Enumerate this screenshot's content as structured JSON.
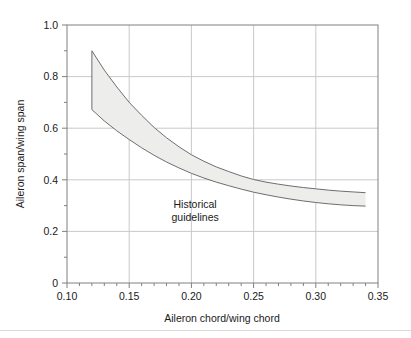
{
  "figure": {
    "background_color": "#ffffff",
    "plot_area": {
      "left_px": 67,
      "top_px": 25,
      "right_px": 378,
      "bottom_px": 283,
      "frame_color": "#808080",
      "grid_color": "#c9c9c9"
    },
    "footer_rule_y_px": 330,
    "footer_rule_color": "#d9d9d9"
  },
  "chart_data": {
    "type": "area",
    "title": "",
    "subtitle": "",
    "xlabel": "Aileron chord/wing chord",
    "ylabel": "Aileron span/wing span",
    "xlim": [
      0.1,
      0.35
    ],
    "ylim": [
      0.0,
      1.0
    ],
    "xticks": [
      0.1,
      0.15,
      0.2,
      0.25,
      0.3,
      0.35
    ],
    "xtick_labels": [
      "0.10",
      "0.15",
      "0.20",
      "0.25",
      "0.30",
      "0.35"
    ],
    "xminor_step": 0.01,
    "yticks": [
      0,
      0.2,
      0.4,
      0.6,
      0.8,
      1.0
    ],
    "ytick_labels": [
      "0",
      "0.2",
      "0.4",
      "0.6",
      "0.8",
      "1.0"
    ],
    "yminor_step": 0.1,
    "grid": true,
    "grid_axes": "both",
    "legend": "none",
    "band_fill_color": "#ededeb",
    "band_edge_color": "#6e6e6e",
    "x": [
      0.12,
      0.13,
      0.14,
      0.15,
      0.16,
      0.17,
      0.18,
      0.19,
      0.2,
      0.21,
      0.22,
      0.23,
      0.24,
      0.25,
      0.26,
      0.27,
      0.28,
      0.29,
      0.3,
      0.31,
      0.32,
      0.33,
      0.34
    ],
    "series": [
      {
        "name": "Upper bound",
        "values": [
          0.9,
          0.825,
          0.76,
          0.7,
          0.65,
          0.603,
          0.563,
          0.528,
          0.497,
          0.472,
          0.45,
          0.432,
          0.415,
          0.401,
          0.391,
          0.383,
          0.376,
          0.37,
          0.365,
          0.36,
          0.356,
          0.353,
          0.35
        ]
      },
      {
        "name": "Lower bound",
        "values": [
          0.672,
          0.628,
          0.59,
          0.556,
          0.524,
          0.495,
          0.469,
          0.446,
          0.425,
          0.407,
          0.391,
          0.377,
          0.364,
          0.352,
          0.342,
          0.333,
          0.325,
          0.318,
          0.312,
          0.307,
          0.303,
          0.3,
          0.298
        ]
      }
    ],
    "annotations": [
      {
        "text_line_1": "Historical",
        "text_line_2": "guidelines",
        "x": 0.203,
        "y": 0.29
      }
    ]
  }
}
